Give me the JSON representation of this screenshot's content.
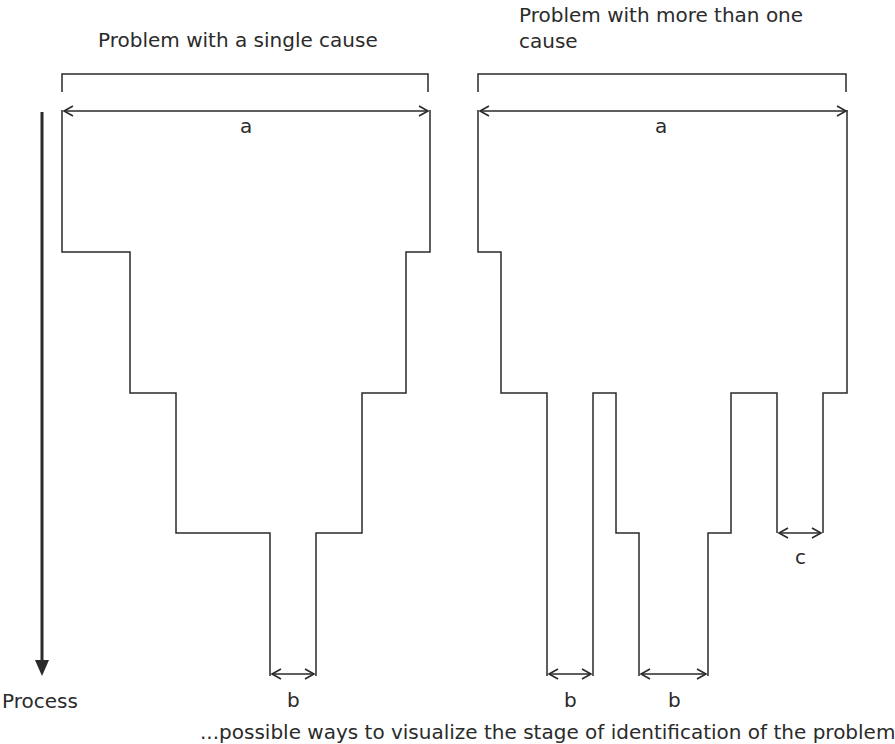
{
  "diagram": {
    "left_panel": {
      "title": "Problem with a single cause",
      "width_label": "a",
      "narrow_label": "b"
    },
    "right_panel": {
      "title": "Problem with more than one cause",
      "width_label": "a",
      "narrow_labels": [
        "b",
        "b"
      ],
      "side_label": "c"
    },
    "axis": {
      "label": "Process",
      "direction": "down"
    },
    "caption": "...possible ways to visualize the stage of identification of the problem",
    "colors": {
      "line": "#2a2a2a",
      "background": "#ffffff"
    }
  }
}
